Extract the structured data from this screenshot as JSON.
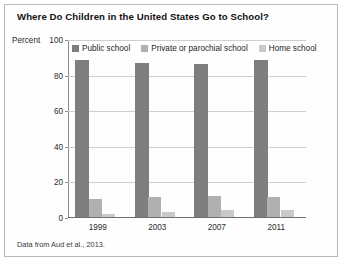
{
  "figure": {
    "title": "Where Do Children in the United States Go to School?",
    "y_axis_label": "Percent",
    "source_note": "Data from Aud et al., 2013."
  },
  "colors": {
    "public_school": "#7e7e7e",
    "private_or_parochial_school": "#b0b0b0",
    "home_school": "#c9c9c9",
    "gridline": "#cfcfcf",
    "axis": "#8c8c8c",
    "frame": "#b9b9b9",
    "background": "#ffffff",
    "text": "#1f1f1f"
  },
  "legend": {
    "position": "top-inside",
    "items": [
      {
        "label": "Public school",
        "color": "#7e7e7e"
      },
      {
        "label": "Private or parochial school",
        "color": "#b0b0b0"
      },
      {
        "label": "Home school",
        "color": "#c9c9c9"
      }
    ]
  },
  "y_ticks": [
    {
      "label": "100",
      "value": 100
    },
    {
      "label": "80",
      "value": 80
    },
    {
      "label": "60",
      "value": 60
    },
    {
      "label": "40",
      "value": 40
    },
    {
      "label": "20",
      "value": 20
    },
    {
      "label": "0",
      "value": 0
    }
  ],
  "x_ticks": [
    {
      "label": "1999"
    },
    {
      "label": "2003"
    },
    {
      "label": "2007"
    },
    {
      "label": "2011"
    }
  ],
  "chart_data": {
    "type": "bar",
    "title": "Where Do Children in the United States Go to School?",
    "subtitle": "",
    "xlabel": "",
    "ylabel": "Percent",
    "ylim": [
      0,
      100
    ],
    "yticks": [
      0,
      20,
      40,
      60,
      80,
      100
    ],
    "grid": true,
    "grid_axis": "y",
    "legend_position": "top-inside",
    "annotations": [
      "Data from Aud et al., 2013."
    ],
    "categories": [
      "1999",
      "2003",
      "2007",
      "2011"
    ],
    "series": [
      {
        "name": "Public school",
        "color": "#7e7e7e",
        "values": [
          88,
          86.5,
          86,
          88
        ]
      },
      {
        "name": "Private or parochial school",
        "color": "#b0b0b0",
        "values": [
          10,
          11.5,
          11.8,
          11
        ]
      },
      {
        "name": "Home school",
        "color": "#c9c9c9",
        "values": [
          1.5,
          3,
          4,
          4
        ]
      }
    ],
    "units": "percent"
  }
}
